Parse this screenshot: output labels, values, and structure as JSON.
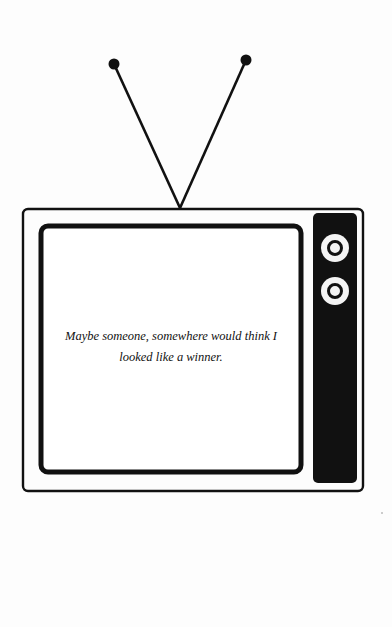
{
  "illustration": {
    "subject": "retro-television",
    "caption": "Maybe someone, somewhere would think I looked like a winner.",
    "colors": {
      "ink": "#111111",
      "paper": "#fdfdfd"
    },
    "antenna": {
      "left_tip": [
        114,
        64
      ],
      "right_tip": [
        246,
        60
      ],
      "base": [
        180,
        208
      ]
    },
    "knobs": [
      {
        "name": "knob-top"
      },
      {
        "name": "knob-bottom"
      }
    ]
  }
}
